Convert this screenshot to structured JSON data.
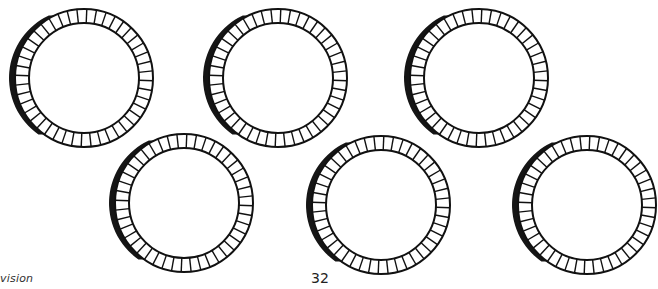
{
  "footer": {
    "left_text": "vision",
    "page_number": "32"
  },
  "colors": {
    "stroke": "#111111",
    "shadow": "#151515",
    "background": "#ffffff"
  },
  "rings": [
    {
      "id": "ring-1",
      "cx": 84,
      "cy": 78,
      "outer_r": 69,
      "inner_r": 55,
      "segments": 44
    },
    {
      "id": "ring-2",
      "cx": 278,
      "cy": 78,
      "outer_r": 69,
      "inner_r": 55,
      "segments": 44
    },
    {
      "id": "ring-3",
      "cx": 479,
      "cy": 78,
      "outer_r": 69,
      "inner_r": 55,
      "segments": 44
    },
    {
      "id": "ring-4",
      "cx": 184,
      "cy": 203,
      "outer_r": 69,
      "inner_r": 55,
      "segments": 44
    },
    {
      "id": "ring-5",
      "cx": 381,
      "cy": 205,
      "outer_r": 69,
      "inner_r": 55,
      "segments": 44
    },
    {
      "id": "ring-6",
      "cx": 587,
      "cy": 205,
      "outer_r": 69,
      "inner_r": 55,
      "segments": 44
    }
  ]
}
